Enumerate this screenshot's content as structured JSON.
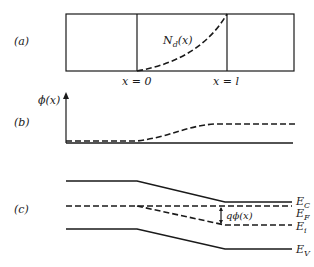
{
  "panel_a": {
    "label": "(a)",
    "curve_label": "N",
    "curve_label_sub": "d",
    "curve_label_arg": "(x)",
    "tick_left": "x = 0",
    "tick_right": "x = l"
  },
  "panel_b": {
    "label": "(b)",
    "y_axis_label": "ϕ(x)"
  },
  "panel_c": {
    "label": "(c)",
    "ec_label": "E",
    "ec_sub": "C",
    "ef_label": "E",
    "ef_sub": "F",
    "ei_label": "E",
    "ei_sub": "i",
    "ev_label": "E",
    "ev_sub": "V",
    "arrow_label": "qϕ(x)"
  },
  "colors": {
    "ink": "#1a1a1a",
    "background": "#ffffff"
  }
}
